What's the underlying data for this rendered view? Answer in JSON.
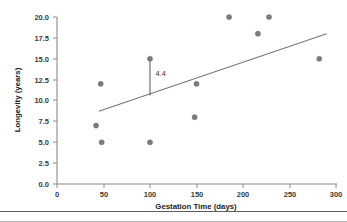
{
  "chart_data": {
    "type": "scatter",
    "title": "",
    "xlabel": "Gestation Time (days)",
    "ylabel": "Longevity (years)",
    "xlim": [
      0,
      320
    ],
    "ylim": [
      0,
      21
    ],
    "grid": false,
    "legend": "none",
    "xticks": [
      0,
      50,
      100,
      150,
      200,
      250,
      300
    ],
    "xtick_labels": [
      "0",
      "50",
      "100",
      "150",
      "200",
      "250",
      "300"
    ],
    "yticks": [
      0.0,
      2.5,
      5.0,
      7.5,
      10.0,
      12.5,
      15.0,
      17.5,
      20.0
    ],
    "ytick_labels": [
      "0.0",
      "2.5",
      "5.0",
      "7.5",
      "10.0",
      "12.5",
      "15.0",
      "17.5",
      "20.0"
    ],
    "points": [
      {
        "x": 42,
        "y": 7.0
      },
      {
        "x": 47,
        "y": 12.0
      },
      {
        "x": 48,
        "y": 5.0
      },
      {
        "x": 100,
        "y": 5.0
      },
      {
        "x": 100,
        "y": 15.0
      },
      {
        "x": 150,
        "y": 12.0
      },
      {
        "x": 148,
        "y": 8.0
      },
      {
        "x": 185,
        "y": 20.0
      },
      {
        "x": 216,
        "y": 18.0
      },
      {
        "x": 228,
        "y": 20.0
      },
      {
        "x": 282,
        "y": 15.0
      }
    ],
    "fit_line": {
      "x1": 45,
      "y1": 8.7,
      "x2": 290,
      "y2": 18.0
    },
    "annotation": {
      "label": "4.4",
      "x": 100,
      "y_top": 15.0,
      "y_bottom": 10.6,
      "label_x": 106,
      "label_y": 12.9
    }
  }
}
